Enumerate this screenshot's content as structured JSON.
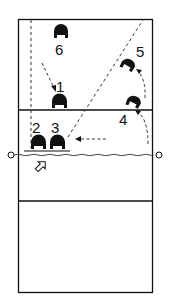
{
  "diagram": {
    "type": "volleyball-court-rotation",
    "colors": {
      "line": "#111111",
      "background": "#ffffff"
    },
    "players": [
      {
        "label": "1",
        "x": 60,
        "y": 103
      },
      {
        "label": "2",
        "x": 38,
        "y": 144
      },
      {
        "label": "3",
        "x": 58,
        "y": 144
      },
      {
        "label": "4",
        "x": 134,
        "y": 103
      },
      {
        "label": "5",
        "x": 128,
        "y": 66
      },
      {
        "label": "6",
        "x": 61,
        "y": 35
      }
    ],
    "labels": {
      "p1": "1",
      "p2": "2",
      "p3": "3",
      "p4": "4",
      "p5": "5",
      "p6": "6"
    }
  }
}
